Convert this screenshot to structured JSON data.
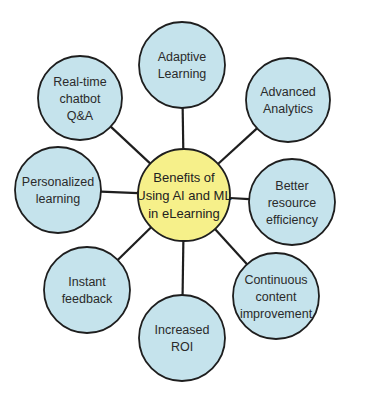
{
  "colors": {
    "node_fill": "#c5e3ec",
    "hub_fill": "#f6f08a",
    "stroke": "#1e1e1e",
    "text": "#2a2a2a"
  },
  "hub": {
    "lines": [
      "Benefits of",
      "Using AI and ML",
      "in eLearning"
    ],
    "cx": 184,
    "cy": 195,
    "r": 46
  },
  "nodes": [
    {
      "id": "adaptive-learning",
      "lines": [
        "Adaptive",
        "Learning"
      ],
      "cx": 182,
      "cy": 65,
      "r": 43
    },
    {
      "id": "advanced-analytics",
      "lines": [
        "Advanced",
        "Analytics"
      ],
      "cx": 288,
      "cy": 100,
      "r": 42
    },
    {
      "id": "better-resource-efficiency",
      "lines": [
        "Better",
        "resource",
        "efficiency"
      ],
      "cx": 292,
      "cy": 202,
      "r": 43
    },
    {
      "id": "continuous-content-improvement",
      "lines": [
        "Continuous",
        "content",
        "improvement"
      ],
      "cx": 276,
      "cy": 296,
      "r": 43
    },
    {
      "id": "increased-roi",
      "lines": [
        "Increased",
        "ROI"
      ],
      "cx": 182,
      "cy": 338,
      "r": 43
    },
    {
      "id": "instant-feedback",
      "lines": [
        "Instant",
        "feedback"
      ],
      "cx": 87,
      "cy": 290,
      "r": 43
    },
    {
      "id": "personalized-learning",
      "lines": [
        "Personalized",
        "learning"
      ],
      "cx": 58,
      "cy": 190,
      "r": 43
    },
    {
      "id": "real-time-chatbot-qa",
      "lines": [
        "Real-time",
        "chatbot",
        "Q&A"
      ],
      "cx": 80,
      "cy": 98,
      "r": 42
    }
  ]
}
